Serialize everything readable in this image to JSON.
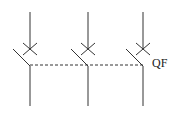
{
  "diagram": {
    "type": "three-pole circuit breaker symbol",
    "label": "QF",
    "poles": 3,
    "line_color": "#333333"
  }
}
